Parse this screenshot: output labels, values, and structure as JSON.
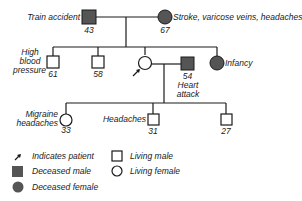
{
  "pedigree": {
    "generation1": {
      "father": {
        "sex": "male",
        "status": "deceased",
        "age": "43",
        "label": "Train accident"
      },
      "mother": {
        "sex": "female",
        "status": "deceased",
        "age": "67",
        "label": "Stroke, varicose veins, headaches"
      }
    },
    "generation2": {
      "sibling1": {
        "sex": "male",
        "status": "living",
        "age": "61",
        "label_lines": [
          "High",
          "blood",
          "pressure"
        ]
      },
      "sibling2": {
        "sex": "male",
        "status": "living",
        "age": "58"
      },
      "patient": {
        "sex": "female",
        "status": "living",
        "is_patient": true
      },
      "spouse": {
        "sex": "male",
        "status": "deceased",
        "age": "54",
        "label_lines": [
          "Heart",
          "attack"
        ]
      },
      "sibling3": {
        "sex": "female",
        "status": "deceased",
        "label": "Infancy"
      }
    },
    "generation3": {
      "child1": {
        "sex": "female",
        "status": "living",
        "age": "33",
        "label_lines": [
          "Migraine",
          "headaches"
        ]
      },
      "child2": {
        "sex": "male",
        "status": "living",
        "age": "31",
        "label": "Headaches"
      },
      "child3": {
        "sex": "male",
        "status": "living",
        "age": "27"
      }
    }
  },
  "legend": {
    "patient": "Indicates patient",
    "deceased_male": "Deceased male",
    "deceased_female": "Deceased female",
    "living_male": "Living male",
    "living_female": "Living female"
  },
  "colors": {
    "line": "#1a1a1a",
    "deceased_fill": "#555555"
  }
}
